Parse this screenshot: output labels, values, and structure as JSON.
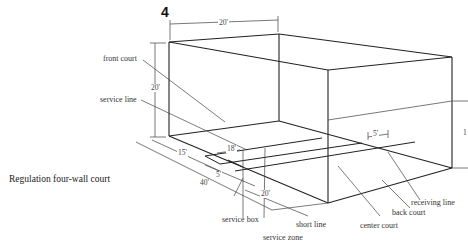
{
  "figure": {
    "number": "4",
    "caption": "Regulation four-wall court"
  },
  "labels": {
    "front_court": "front court",
    "service_line": "service line",
    "service_box": "service box",
    "service_zone": "service zone",
    "short_line": "short line",
    "center_court": "center court",
    "back_court": "back court",
    "receiving_line": "receiving line"
  },
  "dimensions": {
    "width_top": "20'",
    "height_front": "20'",
    "front_court_depth": "15'",
    "service_box_width": "18'",
    "service_zone_depth": "5'",
    "total_length": "40'",
    "back_half": "20'",
    "receiving_line_offset": "5'",
    "back_wall_height": "1"
  }
}
